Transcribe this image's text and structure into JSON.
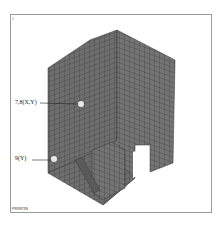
{
  "figure": {
    "corner_mark": "1",
    "bottom_tag": "PRINTIN",
    "colors": {
      "mesh_fill": "#6e6e6e",
      "mesh_line": "#3a3a3a",
      "frame": "#9a9a9a",
      "point": "#e8e8e8"
    },
    "annotations": [
      {
        "id": "node-7-8",
        "label": "7,8(X,Y)"
      },
      {
        "id": "node-9",
        "label": "9(Y)"
      }
    ]
  }
}
